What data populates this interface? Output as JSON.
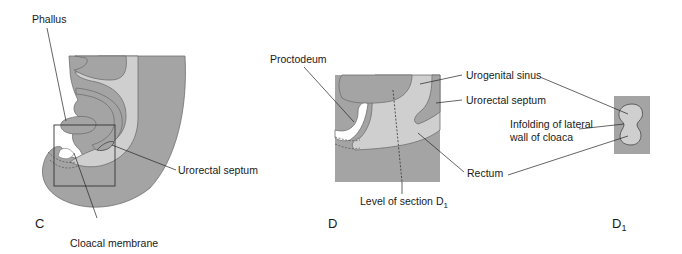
{
  "figure": {
    "colors": {
      "dark_tissue": "#a4a4a4",
      "light_tissue": "#cfcfcf",
      "outline": "#6e6e6e",
      "line": "#222222",
      "background": "#ffffff"
    },
    "panels": [
      {
        "id": "C",
        "label": "C",
        "annotations": {
          "phallus": "Phallus",
          "urorectal_septum": "Urorectal septum",
          "cloacal_membrane": "Cloacal membrane"
        }
      },
      {
        "id": "D",
        "label": "D",
        "annotations": {
          "proctodeum": "Proctodeum",
          "urogenital_sinus": "Urogenital sinus",
          "urorectal_septum": "Urorectal septum",
          "rectum": "Rectum",
          "level_of_section": "Level of section D",
          "level_of_section_sub": "1"
        }
      },
      {
        "id": "D1",
        "label": "D",
        "label_sub": "1",
        "annotations": {
          "infolding_line1": "Infolding of lateral",
          "infolding_line2": "wall of cloaca"
        }
      }
    ]
  }
}
